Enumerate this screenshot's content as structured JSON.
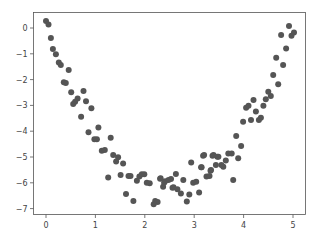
{
  "chart_data": {
    "type": "scatter",
    "title": "",
    "xlabel": "",
    "ylabel": "",
    "xlim": [
      -0.25,
      5.25
    ],
    "ylim": [
      -7.15,
      0.6
    ],
    "xticks": [
      0,
      1,
      2,
      3,
      4,
      5
    ],
    "yticks": [
      0,
      -1,
      -2,
      -3,
      -4,
      -5,
      -6,
      -7
    ],
    "grid": false,
    "legend": null,
    "marker_color": "#555555",
    "series": [
      {
        "name": "data",
        "points": [
          [
            0.0,
            0.27
          ],
          [
            0.05,
            0.13
          ],
          [
            0.1,
            -0.39
          ],
          [
            0.14,
            -0.81
          ],
          [
            0.2,
            -1.02
          ],
          [
            0.26,
            -1.34
          ],
          [
            0.3,
            -1.43
          ],
          [
            0.46,
            -1.63
          ],
          [
            0.36,
            -2.1
          ],
          [
            0.4,
            -2.13
          ],
          [
            0.51,
            -2.49
          ],
          [
            0.76,
            -2.44
          ],
          [
            0.64,
            -2.73
          ],
          [
            0.59,
            -2.86
          ],
          [
            0.55,
            -2.95
          ],
          [
            0.81,
            -2.84
          ],
          [
            0.92,
            -3.11
          ],
          [
            0.71,
            -3.44
          ],
          [
            0.86,
            -4.04
          ],
          [
            1.06,
            -3.86
          ],
          [
            0.98,
            -4.31
          ],
          [
            1.03,
            -4.31
          ],
          [
            1.31,
            -4.25
          ],
          [
            1.13,
            -4.76
          ],
          [
            1.19,
            -4.73
          ],
          [
            1.36,
            -4.92
          ],
          [
            1.46,
            -5.01
          ],
          [
            1.42,
            -5.18
          ],
          [
            1.56,
            -5.25
          ],
          [
            1.26,
            -5.79
          ],
          [
            1.51,
            -5.7
          ],
          [
            1.67,
            -5.74
          ],
          [
            1.71,
            -5.74
          ],
          [
            1.84,
            -5.92
          ],
          [
            1.89,
            -5.76
          ],
          [
            1.94,
            -5.67
          ],
          [
            1.99,
            -5.67
          ],
          [
            2.04,
            -6.0
          ],
          [
            2.1,
            -6.02
          ],
          [
            1.62,
            -6.43
          ],
          [
            1.77,
            -6.71
          ],
          [
            2.31,
            -5.84
          ],
          [
            2.21,
            -6.71
          ],
          [
            2.26,
            -6.74
          ],
          [
            2.18,
            -6.83
          ],
          [
            2.37,
            -6.15
          ],
          [
            2.41,
            -5.94
          ],
          [
            2.48,
            -5.89
          ],
          [
            2.53,
            -5.85
          ],
          [
            2.56,
            -6.19
          ],
          [
            2.32,
            -5.82
          ],
          [
            2.39,
            -6.0
          ],
          [
            2.63,
            -5.66
          ],
          [
            2.58,
            -6.17
          ],
          [
            2.66,
            -6.25
          ],
          [
            2.73,
            -6.41
          ],
          [
            2.78,
            -5.89
          ],
          [
            2.85,
            -6.73
          ],
          [
            2.9,
            -6.45
          ],
          [
            2.94,
            -5.21
          ],
          [
            2.98,
            -6.0
          ],
          [
            3.04,
            -5.96
          ],
          [
            3.1,
            -6.38
          ],
          [
            3.14,
            -5.4
          ],
          [
            3.18,
            -4.95
          ],
          [
            3.25,
            -5.76
          ],
          [
            3.31,
            -5.74
          ],
          [
            3.33,
            -5.53
          ],
          [
            3.37,
            -4.95
          ],
          [
            3.47,
            -4.99
          ],
          [
            3.15,
            -5.4
          ],
          [
            3.2,
            -4.92
          ],
          [
            3.39,
            -4.92
          ],
          [
            3.49,
            -4.99
          ],
          [
            3.69,
            -4.86
          ],
          [
            3.76,
            -4.86
          ],
          [
            3.89,
            -5.05
          ],
          [
            3.64,
            -5.14
          ],
          [
            3.44,
            -5.31
          ],
          [
            3.55,
            -5.31
          ],
          [
            3.59,
            -5.38
          ],
          [
            3.34,
            -5.5
          ],
          [
            3.79,
            -5.89
          ],
          [
            3.85,
            -4.19
          ],
          [
            3.95,
            -4.57
          ],
          [
            3.99,
            -3.63
          ],
          [
            4.15,
            -3.57
          ],
          [
            4.31,
            -3.57
          ],
          [
            4.35,
            -3.48
          ],
          [
            4.05,
            -3.09
          ],
          [
            4.1,
            -3.01
          ],
          [
            4.25,
            -3.24
          ],
          [
            4.2,
            -2.79
          ],
          [
            4.4,
            -3.01
          ],
          [
            4.45,
            -2.76
          ],
          [
            4.5,
            -2.47
          ],
          [
            4.55,
            -2.64
          ],
          [
            4.6,
            -1.82
          ],
          [
            4.7,
            -2.18
          ],
          [
            4.66,
            -1.15
          ],
          [
            4.8,
            -1.43
          ],
          [
            4.86,
            -0.79
          ],
          [
            4.76,
            -0.27
          ],
          [
            4.92,
            0.08
          ],
          [
            4.97,
            -0.3
          ],
          [
            5.02,
            -0.17
          ]
        ]
      }
    ]
  }
}
